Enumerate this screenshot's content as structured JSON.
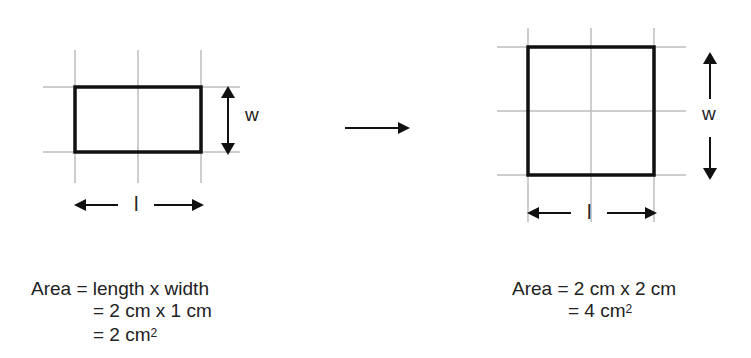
{
  "left_figure": {
    "grid": {
      "columns": 2,
      "rows": 1
    },
    "width_label": "w",
    "length_label": "l",
    "formula": {
      "line1": "Area = length x width",
      "line2": "= 2 cm x 1 cm",
      "line3_prefix": "= 2 cm",
      "line3_sup": "2"
    }
  },
  "transition_arrow": "right-arrow",
  "right_figure": {
    "grid": {
      "columns": 2,
      "rows": 2
    },
    "width_label": "w",
    "length_label": "l",
    "formula": {
      "line1": "Area = 2 cm x 2 cm",
      "line2_prefix": "= 4 cm",
      "line2_sup": "2"
    }
  },
  "colors": {
    "grid_line": "#bdbdbd",
    "shape_outline": "#111111",
    "text": "#222222"
  }
}
